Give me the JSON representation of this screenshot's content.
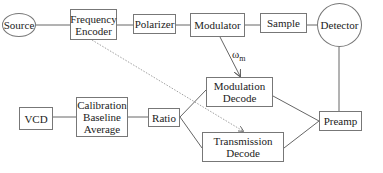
{
  "diagram": {
    "nodes": {
      "source": {
        "label": "Source",
        "shape": "ellipse"
      },
      "frequency_encoder": {
        "label": "Frequency Encoder",
        "shape": "box"
      },
      "polarizer": {
        "label": "Polarizer",
        "shape": "box"
      },
      "modulator": {
        "label": "Modulator",
        "shape": "box"
      },
      "sample": {
        "label": "Sample",
        "shape": "box"
      },
      "detector": {
        "label": "Detector",
        "shape": "ellipse"
      },
      "modulation_decode": {
        "label": "Modulation Decode",
        "shape": "box"
      },
      "vcd": {
        "label": "VCD",
        "shape": "box"
      },
      "calibration": {
        "label": "Calibration Baseline Average",
        "shape": "box"
      },
      "ratio": {
        "label": "Ratio",
        "shape": "box"
      },
      "preamp": {
        "label": "Preamp",
        "shape": "box"
      },
      "transmission_decode": {
        "label": "Transmission Decode",
        "shape": "box"
      }
    },
    "edge_labels": {
      "omega_symbol": "ω",
      "omega_subscript": "m"
    },
    "edges": [
      {
        "from": "Source",
        "to": "Frequency Encoder",
        "style": "solid"
      },
      {
        "from": "Frequency Encoder",
        "to": "Polarizer",
        "style": "solid"
      },
      {
        "from": "Polarizer",
        "to": "Modulator",
        "style": "solid"
      },
      {
        "from": "Modulator",
        "to": "Sample",
        "style": "solid"
      },
      {
        "from": "Sample",
        "to": "Detector",
        "style": "solid"
      },
      {
        "from": "Detector",
        "to": "Preamp",
        "style": "solid"
      },
      {
        "from": "Modulator",
        "to": "Modulation Decode",
        "style": "arrow",
        "label": "ωm"
      },
      {
        "from": "Frequency Encoder",
        "to": "Transmission Decode",
        "style": "dotted-arrow"
      },
      {
        "from": "Preamp",
        "to": "Modulation Decode",
        "style": "solid"
      },
      {
        "from": "Preamp",
        "to": "Transmission Decode",
        "style": "solid"
      },
      {
        "from": "Modulation Decode",
        "to": "Ratio",
        "style": "solid"
      },
      {
        "from": "Transmission Decode",
        "to": "Ratio",
        "style": "solid"
      },
      {
        "from": "Ratio",
        "to": "Calibration Baseline Average",
        "style": "solid"
      },
      {
        "from": "Calibration Baseline Average",
        "to": "VCD",
        "style": "solid"
      }
    ],
    "colors": {
      "line": "#666666",
      "dotted": "#888888",
      "text": "#222222"
    }
  }
}
